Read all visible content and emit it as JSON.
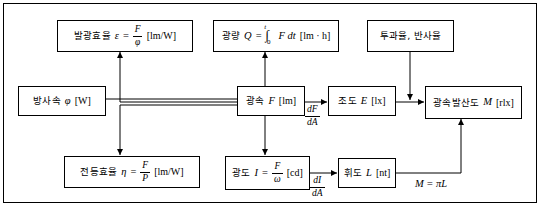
{
  "diagram": {
    "nodes": {
      "luminous_efficacy": {
        "label": "발광효율",
        "symbol": "ε",
        "eq": "=",
        "num": "F",
        "den": "φ",
        "unit": "[lm/W]"
      },
      "quantity_of_light": {
        "label": "광량",
        "symbol": "Q",
        "eq": "=",
        "integral": "∫",
        "lower": "0",
        "upper": "t",
        "integrand": "F dt",
        "unit": "[lm · h]"
      },
      "transmittance_reflectance": {
        "label": "투과율, 반사율"
      },
      "radiant_flux": {
        "label": "방사속",
        "symbol": "φ",
        "unit": "[W]"
      },
      "luminous_flux": {
        "label": "광속",
        "symbol": "F",
        "unit": "[lm]"
      },
      "illuminance": {
        "label": "조도",
        "symbol": "E",
        "unit": "[lx]"
      },
      "luminous_emittance": {
        "label": "광속발산도",
        "symbol": "M",
        "unit": "[rlx]"
      },
      "lamp_efficiency": {
        "label": "전등효율",
        "symbol": "η",
        "eq": "=",
        "num": "F",
        "den": "P",
        "unit": "[lm/W]"
      },
      "luminous_intensity": {
        "label": "광도",
        "symbol": "I",
        "eq": "=",
        "num": "F",
        "den": "ω",
        "unit": "[cd]"
      },
      "luminance": {
        "label": "휘도",
        "symbol": "L",
        "unit": "[nt]"
      }
    },
    "edge_labels": {
      "flux_to_illuminance": {
        "num": "dF",
        "den": "dA"
      },
      "flux_to_intensity": {
        "num": "dF",
        "den": "dA"
      },
      "intensity_to_luminance": {
        "num": "dI",
        "den": "dA"
      },
      "luminance_to_emittance": "M = πL"
    },
    "colors": {
      "line": "#000000",
      "background": "#ffffff",
      "text": "#000000"
    }
  }
}
